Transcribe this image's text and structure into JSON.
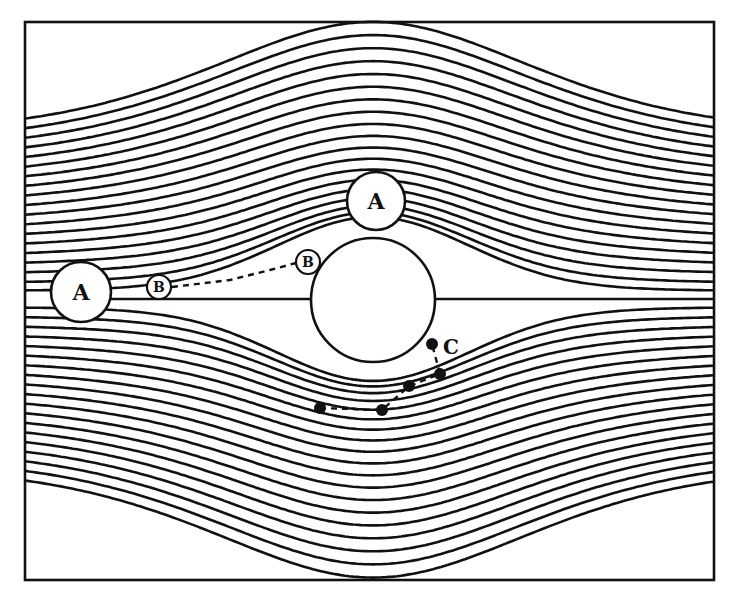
{
  "figure": {
    "width": 753,
    "height": 596,
    "background": "#ffffff",
    "ink": "#111111",
    "frame": {
      "x": 25,
      "y": 22,
      "width": 689,
      "height": 558
    },
    "centerline_y": 299
  },
  "obstacle": {
    "name": "collector",
    "cx": 373,
    "cy": 300,
    "r": 62
  },
  "streamlines": {
    "upper_left_edge_y": [
      130,
      139,
      148,
      157,
      166,
      175,
      184,
      193,
      202,
      211,
      220,
      229,
      238,
      247,
      256,
      265,
      274,
      283,
      291
    ],
    "lower_left_edge_y": [
      307,
      316,
      325,
      334,
      343,
      352,
      361,
      370,
      379,
      388,
      397,
      406,
      415,
      424,
      433,
      442,
      451,
      460,
      469
    ],
    "stroke_width": 2.6
  },
  "particles": {
    "A_left": {
      "label": "A",
      "cx": 81,
      "cy": 292,
      "r": 30
    },
    "A_top": {
      "label": "A",
      "cx": 376,
      "cy": 201,
      "r": 29
    },
    "B_left": {
      "label": "B",
      "cx": 159,
      "cy": 287,
      "r": 12
    },
    "B_upper": {
      "label": "B",
      "cx": 308,
      "cy": 262,
      "r": 12
    }
  },
  "trajectories": {
    "B_path": [
      [
        172,
        287
      ],
      [
        230,
        280
      ],
      [
        270,
        270
      ],
      [
        296,
        263
      ]
    ],
    "C_path": [
      [
        320,
        408
      ],
      [
        382,
        410
      ],
      [
        409,
        386
      ],
      [
        440,
        374
      ],
      [
        432,
        344
      ]
    ]
  },
  "dots": [
    {
      "cx": 432,
      "cy": 344,
      "r": 6
    },
    {
      "cx": 440,
      "cy": 374,
      "r": 6
    },
    {
      "cx": 409,
      "cy": 386,
      "r": 6
    },
    {
      "cx": 382,
      "cy": 410,
      "r": 6
    },
    {
      "cx": 320,
      "cy": 408,
      "r": 6
    }
  ],
  "labels": {
    "A_left": "A",
    "A_top": "A",
    "B_left": "B",
    "B_upper": "B",
    "C": "C"
  },
  "label_positions": {
    "C": {
      "x": 443,
      "y": 354
    }
  }
}
